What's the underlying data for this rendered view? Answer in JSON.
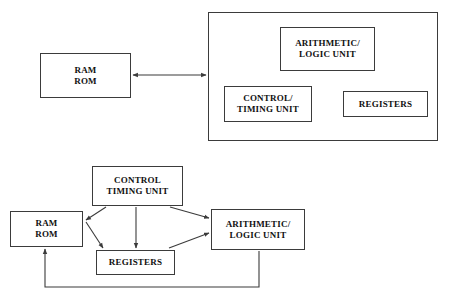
{
  "page": {
    "background_color": "#ffffff",
    "line_color": "#3b3b3b",
    "text_color": "#111111",
    "width": 451,
    "height": 302
  },
  "top_diagram": {
    "name": "cpu-block-diagram-grouped",
    "outer_container_label": "",
    "boxes": {
      "memory": {
        "label": "RAM\nROM"
      },
      "alu": {
        "label": "ARITHMETIC/\nLOGIC UNIT"
      },
      "control": {
        "label": "CONTROL/\nTIMING UNIT"
      },
      "registers": {
        "label": "REGISTERS"
      }
    },
    "connectors": [
      {
        "from": "memory",
        "to": "cpu",
        "type": "double-arrow"
      }
    ]
  },
  "bottom_diagram": {
    "name": "cpu-block-diagram-detailed",
    "boxes": {
      "control": {
        "label": "CONTROL\nTIMING UNIT"
      },
      "memory": {
        "label": "RAM\nROM"
      },
      "registers": {
        "label": "REGISTERS"
      },
      "alu": {
        "label": "ARITHMETIC/\nLOGIC UNIT"
      }
    },
    "connectors": [
      {
        "from": "control",
        "to": "memory",
        "type": "arrow"
      },
      {
        "from": "control",
        "to": "registers",
        "type": "arrow"
      },
      {
        "from": "control",
        "to": "registers-via-vertical",
        "type": "arrow"
      },
      {
        "from": "control",
        "to": "alu",
        "type": "arrow"
      },
      {
        "from": "memory",
        "to": "registers",
        "type": "arrow"
      },
      {
        "from": "registers",
        "to": "alu",
        "type": "arrow"
      },
      {
        "from": "alu",
        "to": "memory",
        "type": "feedback-arrow"
      }
    ]
  }
}
